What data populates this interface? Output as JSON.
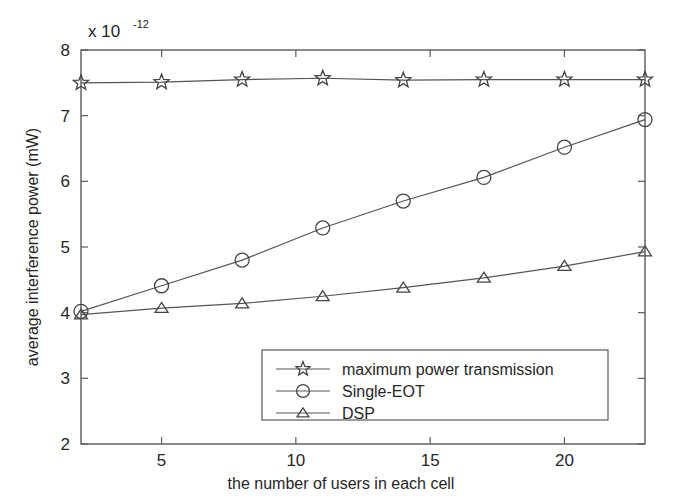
{
  "chart_data": {
    "type": "line",
    "title": "",
    "subtitle": "",
    "xlabel": "the number of users in each cell",
    "ylabel": "average interference power (mW)",
    "y_multiplier_label": "x 10",
    "y_multiplier_exponent": "-12",
    "x": [
      2,
      5,
      8,
      11,
      14,
      17,
      20,
      23
    ],
    "xlim": [
      2,
      23
    ],
    "ylim": [
      2,
      8
    ],
    "xticks": [
      5,
      10,
      15,
      20
    ],
    "xtick_labels": [
      "5",
      "10",
      "15",
      "20"
    ],
    "yticks": [
      2,
      3,
      4,
      5,
      6,
      7,
      8
    ],
    "ytick_labels": [
      "2",
      "3",
      "4",
      "5",
      "6",
      "7",
      "8"
    ],
    "grid": false,
    "legend_position": "lower center",
    "series": [
      {
        "name": "maximum power transmission",
        "marker": "star",
        "color": "#555555",
        "values": [
          7.5,
          7.51,
          7.55,
          7.57,
          7.54,
          7.55,
          7.55,
          7.55
        ]
      },
      {
        "name": "Single-EOT",
        "marker": "circle",
        "color": "#555555",
        "values": [
          4.02,
          4.41,
          4.8,
          5.29,
          5.7,
          6.06,
          6.52,
          6.94
        ]
      },
      {
        "name": "DSP",
        "marker": "triangle",
        "color": "#555555",
        "values": [
          3.97,
          4.07,
          4.14,
          4.25,
          4.38,
          4.53,
          4.71,
          4.93
        ]
      }
    ]
  },
  "legend": {
    "entries": [
      {
        "label": "maximum power transmission",
        "marker": "star"
      },
      {
        "label": "Single-EOT",
        "marker": "circle"
      },
      {
        "label": "DSP",
        "marker": "triangle"
      }
    ]
  }
}
